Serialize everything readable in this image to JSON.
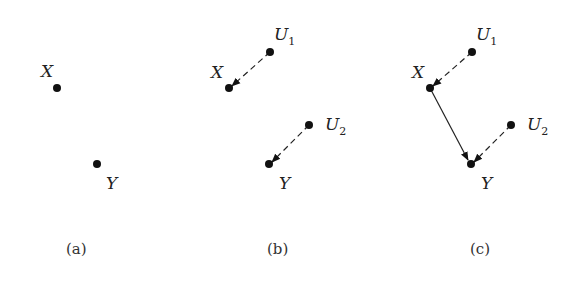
{
  "panels": [
    {
      "caption": "(a)",
      "nodes": [
        {
          "id": "X",
          "label": "X",
          "sub": ""
        },
        {
          "id": "Y",
          "label": "Y",
          "sub": ""
        }
      ],
      "edges": []
    },
    {
      "caption": "(b)",
      "nodes": [
        {
          "id": "U1",
          "label": "U",
          "sub": "1"
        },
        {
          "id": "X",
          "label": "X",
          "sub": ""
        },
        {
          "id": "U2",
          "label": "U",
          "sub": "2"
        },
        {
          "id": "Y",
          "label": "Y",
          "sub": ""
        }
      ],
      "edges": [
        {
          "from": "U1",
          "to": "X",
          "style": "dashed"
        },
        {
          "from": "U2",
          "to": "Y",
          "style": "dashed"
        }
      ]
    },
    {
      "caption": "(c)",
      "nodes": [
        {
          "id": "U1",
          "label": "U",
          "sub": "1"
        },
        {
          "id": "X",
          "label": "X",
          "sub": ""
        },
        {
          "id": "U2",
          "label": "U",
          "sub": "2"
        },
        {
          "id": "Y",
          "label": "Y",
          "sub": ""
        }
      ],
      "edges": [
        {
          "from": "U1",
          "to": "X",
          "style": "dashed"
        },
        {
          "from": "U2",
          "to": "Y",
          "style": "dashed"
        },
        {
          "from": "X",
          "to": "Y",
          "style": "solid"
        }
      ]
    }
  ],
  "colors": {
    "node": "#111111",
    "edge": "#222222",
    "background": "#ffffff"
  }
}
